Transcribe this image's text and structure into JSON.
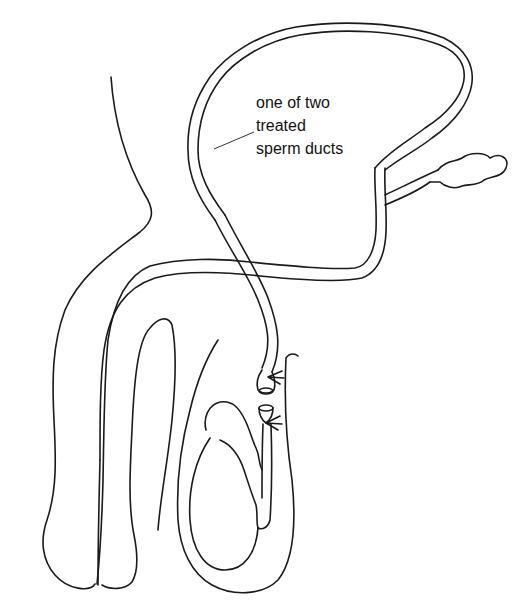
{
  "diagram": {
    "title": "",
    "annotations": [
      {
        "id": "sperm-duct-label",
        "lines": [
          "one of two",
          "treated",
          "sperm ducts"
        ],
        "points_to": "sperm duct (vas deferens)"
      }
    ],
    "parts": [
      {
        "name": "abdominal-wall-outline"
      },
      {
        "name": "bladder"
      },
      {
        "name": "seminal-vesicle"
      },
      {
        "name": "urethra"
      },
      {
        "name": "penis"
      },
      {
        "name": "scrotum"
      },
      {
        "name": "testicle"
      },
      {
        "name": "epididymis"
      },
      {
        "name": "sperm-duct-cut-upper-end",
        "marker": "tied-stitch"
      },
      {
        "name": "sperm-duct-cut-lower-end",
        "marker": "tied-stitch"
      }
    ],
    "colors": {
      "line": "#1a1a1a",
      "background": "#ffffff"
    }
  }
}
